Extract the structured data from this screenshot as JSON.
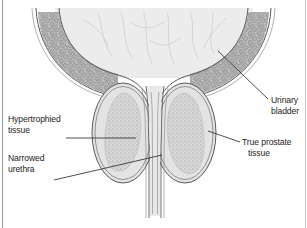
{
  "figure": {
    "background_color": "#ffffff",
    "border_color": "#9a9a9a",
    "width": 307,
    "height": 228
  },
  "palette": {
    "outline": "#555555",
    "bladder_lumen_fill": "#ececec",
    "bladder_wall_fill": "#b4b4b4",
    "bladder_wall_stroke": "#6f6f6f",
    "prostate_capsule_fill": "#e3e3e3",
    "hypertrophied_fill": "#c6c6c6",
    "urethra_fill": "#e6e6e6",
    "rugae_stroke": "#d2d2d2",
    "leader_line": "#3a3a3a",
    "label_text": "#1d1d1d"
  },
  "labels": [
    {
      "id": "hypertrophied-tissue",
      "lines": [
        "Hypertrophied",
        "tissue"
      ],
      "text_x": 8,
      "text_y": 122,
      "anchor": "start",
      "leader": [
        [
          66,
          138
        ],
        [
          136,
          138
        ]
      ]
    },
    {
      "id": "narrowed-urethra",
      "lines": [
        "Narrowed",
        "urethra"
      ],
      "text_x": 8,
      "text_y": 161,
      "anchor": "start",
      "leader": [
        [
          54,
          180
        ],
        [
          162,
          155
        ]
      ]
    },
    {
      "id": "urinary-bladder",
      "lines": [
        "Urinary",
        "bladder"
      ],
      "text_x": 271,
      "text_y": 103,
      "anchor": "start",
      "leader": [
        [
          268,
          99
        ],
        [
          218,
          51
        ]
      ]
    },
    {
      "id": "true-prostate-tissue",
      "lines": [
        "True prostate",
        "tissue"
      ],
      "text_x": 242,
      "text_y": 145,
      "anchor": "start",
      "leader": [
        [
          240,
          142
        ],
        [
          208,
          131
        ]
      ]
    }
  ],
  "anatomy": {
    "urinary_bladder": {
      "name": "Urinary bladder",
      "description": "Dome-shaped bladder cropped at top of frame with pebbled muscular wall and faint rugae in the lumen"
    },
    "bladder_wall": {
      "name": "Bladder wall",
      "description": "Cobblestone muscle layer lining the bladder curve"
    },
    "left_prostate_lobe": {
      "name": "Left prostate lobe",
      "description": "Oval lobe with double-line capsule"
    },
    "right_prostate_lobe": {
      "name": "Right prostate lobe",
      "description": "Oval lobe with double-line capsule"
    },
    "hypertrophied_tissue": {
      "name": "Hypertrophied tissue",
      "description": "Stippled mottled core inside each prostate lobe"
    },
    "true_prostate_tissue": {
      "name": "True prostate tissue",
      "description": "Pale outer rim of the prostate lobe beneath the capsule"
    },
    "narrowed_urethra": {
      "name": "Narrowed urethra",
      "description": "Compressed vertical channel passing between the two lobes"
    }
  }
}
